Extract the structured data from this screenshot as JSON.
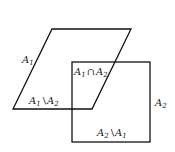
{
  "diagram": {
    "shapes": [
      {
        "id": "A1",
        "type": "parallelogram",
        "points": [
          [
            52,
            29
          ],
          [
            131,
            29
          ],
          [
            92,
            109
          ],
          [
            13,
            109
          ]
        ]
      },
      {
        "id": "A2",
        "type": "square",
        "x": 72,
        "y": 62,
        "width": 78,
        "height": 80
      }
    ],
    "labels": {
      "a1": {
        "main": "A",
        "sub": "1"
      },
      "a2": {
        "main": "A",
        "sub": "2"
      },
      "intersection": {
        "left": "A",
        "left_sub": "1",
        "op": "∩",
        "right": "A",
        "right_sub": "2"
      },
      "a1_minus_a2": {
        "left": "A",
        "left_sub": "1",
        "op": "\\",
        "right": "A",
        "right_sub": "2"
      },
      "a2_minus_a1": {
        "left": "A",
        "left_sub": "2",
        "op": "\\",
        "right": "A",
        "right_sub": "1"
      }
    },
    "stroke_color": "#111111"
  }
}
